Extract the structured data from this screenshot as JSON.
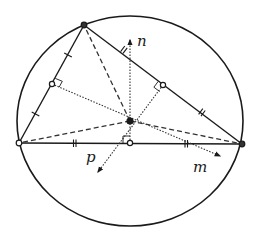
{
  "diagram": {
    "colors": {
      "stroke": "#1a1a1a",
      "background": "#ffffff"
    },
    "labels": {
      "n": "n",
      "p": "p",
      "m": "m"
    },
    "circle": {
      "cx": 130,
      "cy": 121,
      "rx": 113,
      "ry": 105
    },
    "vertices": {
      "A": {
        "x": 84,
        "y": 25
      },
      "B": {
        "x": 19,
        "y": 143
      },
      "C": {
        "x": 242,
        "y": 144
      }
    },
    "circumcenter": {
      "x": 130,
      "y": 121
    },
    "midpoints": {
      "AB": {
        "x": 52,
        "y": 84
      },
      "AC": {
        "x": 163,
        "y": 85
      },
      "BC": {
        "x": 130,
        "y": 143
      }
    },
    "bisectors": [
      {
        "name": "n",
        "from": {
          "x": 130,
          "y": 143
        },
        "to": {
          "x": 130,
          "y": 40
        }
      },
      {
        "name": "p",
        "from": {
          "x": 163,
          "y": 85
        },
        "to": {
          "x": 98,
          "y": 172
        }
      },
      {
        "name": "m",
        "from": {
          "x": 52,
          "y": 84
        },
        "to": {
          "x": 220,
          "y": 156
        }
      }
    ]
  }
}
